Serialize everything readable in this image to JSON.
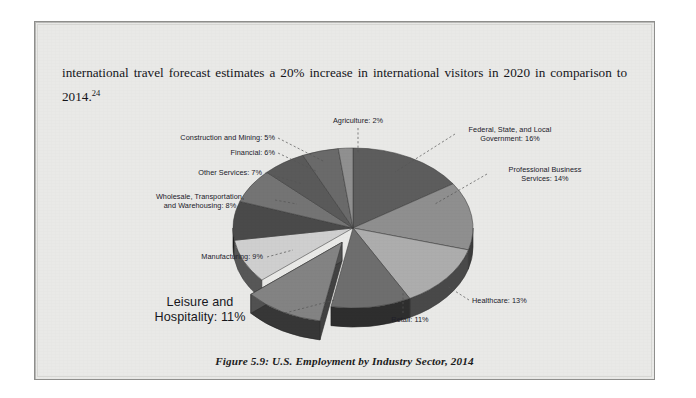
{
  "document": {
    "body_text_before": "international travel forecast estimates a 20% increase in international visitors in 2020 in comparison to 2014.",
    "footnote_marker": "24",
    "caption": "Figure 5.9: U.S. Employment by Industry Sector, 2014"
  },
  "chart_data": {
    "type": "pie",
    "title": "Figure 5.9: U.S. Employment by Industry Sector, 2014",
    "subtitle": "",
    "xlabel": "",
    "ylabel": "",
    "legend_position": "none",
    "grid": false,
    "three_d": true,
    "exploded_slice": "Leisure and Hospitality",
    "units": "percent",
    "categories": [
      "Federal, State, and Local Government",
      "Professional Business Services",
      "Healthcare",
      "Retail",
      "Leisure and Hospitality",
      "Manufacturing",
      "Wholesale, Transportation, and Warehousing",
      "Other Services",
      "Financial",
      "Construction and Mining",
      "Agriculture"
    ],
    "values": [
      16,
      14,
      13,
      11,
      11,
      9,
      8,
      7,
      6,
      5,
      2
    ],
    "labels": [
      "Federal, State, and Local\nGovernment: 16%",
      "Professional Business\nServices: 14%",
      "Healthcare: 13%",
      "Retail: 11%",
      "Leisure and\nHospitality: 11%",
      "Manufacturing: 9%",
      "Wholesale, Transportation,\nand Warehousing: 8%",
      "Other Services: 7%",
      "Financial: 6%",
      "Construction and Mining: 5%",
      "Agriculture: 2%"
    ],
    "colors": [
      "#5d5d5d",
      "#8f8f8f",
      "#adadad",
      "#6e6e6e",
      "#838383",
      "#cfcfcf",
      "#4a4a4a",
      "#747474",
      "#5a5a5a",
      "#6a6a6a",
      "#909090"
    ]
  },
  "palette": {
    "page_background": "#e9e9e7",
    "page_border": "#8e8e8c",
    "text": "#15151a",
    "pie_side_wall": "#2b2b2b"
  }
}
